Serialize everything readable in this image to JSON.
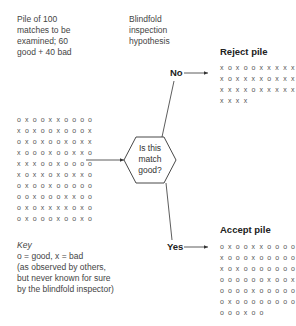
{
  "intro_caption": [
    "Pile of 100",
    "matches to be",
    "examined; 60",
    "good + 40 bad"
  ],
  "hypothesis_caption": [
    "Blindfold",
    "inspection",
    "hypothesis"
  ],
  "decision": {
    "question": [
      "Is this",
      "match",
      "good?"
    ]
  },
  "branches": {
    "no_label": "No",
    "yes_label": "Yes"
  },
  "reject_pile": {
    "title": "Reject pile",
    "rows": [
      "XOXOOXXXXX",
      "XOXXXXOXXX",
      "XXXXOXXXXX",
      "XXXX"
    ]
  },
  "accept_pile": {
    "title": "Accept pile",
    "rows": [
      "OXOOXXOOOO",
      "XOOOXOOOOO",
      "XOXOOOOOOO",
      "OOOOOOXOOX",
      "OOOOXOOOOO",
      "OXOOOOOOOO",
      "OOOXOO"
    ]
  },
  "source_pile": {
    "rows": [
      "OXOOXXOOOO",
      "XOXOOXOOOX",
      "OXOXOOXOXX",
      "XOOOXOOXXO",
      "XXXOOXOOOO",
      "XOXXOXOXXO",
      "OXOOXOOOOO",
      "OOXOOOXXOO",
      "OXOXXXXOXO",
      "OXOOOXOOXO"
    ]
  },
  "key": {
    "title": "Key",
    "lines": [
      "o = good, x = bad",
      "(as observed by others,",
      "but never known for sure",
      "by the blindfold inspector)"
    ]
  }
}
